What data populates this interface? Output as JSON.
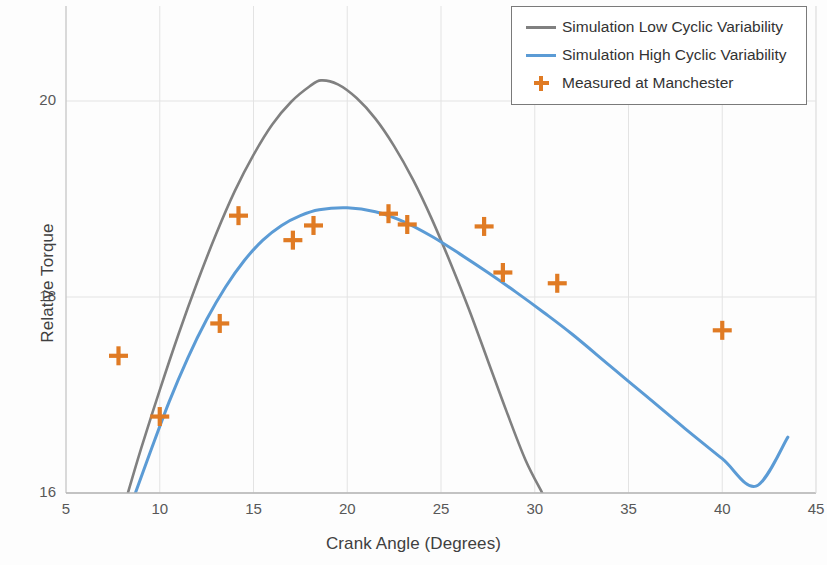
{
  "chart_data": {
    "type": "line",
    "title": "",
    "xlabel": "Crank Angle (Degrees)",
    "ylabel": "Relative Torque",
    "xlim": [
      5,
      45
    ],
    "ylim": [
      16,
      20.45
    ],
    "xticks": [
      5,
      10,
      15,
      20,
      25,
      30,
      35,
      40,
      45
    ],
    "yticks": [
      16,
      18,
      20
    ],
    "grid": true,
    "legend_position": "top-right",
    "series": [
      {
        "name": "Simulation Low Cyclic Variability",
        "type": "line",
        "color": "#808080",
        "points": [
          [
            8.3,
            16.0
          ],
          [
            9.0,
            16.45
          ],
          [
            10.0,
            17.05
          ],
          [
            11.0,
            17.62
          ],
          [
            12.0,
            18.15
          ],
          [
            13.0,
            18.64
          ],
          [
            14.0,
            19.08
          ],
          [
            15.0,
            19.45
          ],
          [
            16.0,
            19.76
          ],
          [
            17.0,
            19.99
          ],
          [
            18.0,
            20.15
          ],
          [
            18.6,
            20.21
          ],
          [
            19.5,
            20.17
          ],
          [
            20.5,
            20.03
          ],
          [
            21.5,
            19.82
          ],
          [
            22.5,
            19.54
          ],
          [
            23.5,
            19.2
          ],
          [
            24.5,
            18.8
          ],
          [
            25.5,
            18.35
          ],
          [
            26.5,
            17.87
          ],
          [
            27.5,
            17.35
          ],
          [
            28.5,
            16.83
          ],
          [
            29.5,
            16.34
          ],
          [
            30.4,
            16.0
          ]
        ]
      },
      {
        "name": "Simulation High Cyclic Variability",
        "type": "line",
        "color": "#5B9BD5",
        "points": [
          [
            8.7,
            16.0
          ],
          [
            9.5,
            16.42
          ],
          [
            10.5,
            16.93
          ],
          [
            11.5,
            17.38
          ],
          [
            12.5,
            17.77
          ],
          [
            13.5,
            18.1
          ],
          [
            14.5,
            18.37
          ],
          [
            15.5,
            18.58
          ],
          [
            16.5,
            18.73
          ],
          [
            17.5,
            18.83
          ],
          [
            18.5,
            18.89
          ],
          [
            20.0,
            18.91
          ],
          [
            21.5,
            18.87
          ],
          [
            23.0,
            18.77
          ],
          [
            24.5,
            18.62
          ],
          [
            26.0,
            18.44
          ],
          [
            27.5,
            18.25
          ],
          [
            29.0,
            18.05
          ],
          [
            30.5,
            17.84
          ],
          [
            32.0,
            17.62
          ],
          [
            34.0,
            17.3
          ],
          [
            36.0,
            16.98
          ],
          [
            38.0,
            16.66
          ],
          [
            40.0,
            16.35
          ],
          [
            41.8,
            16.07
          ],
          [
            43.5,
            16.57
          ]
        ]
      },
      {
        "name": "Measured at Manchester",
        "type": "scatter",
        "color": "#E07B24",
        "points": [
          [
            7.8,
            17.4
          ],
          [
            10.0,
            16.78
          ],
          [
            13.2,
            17.73
          ],
          [
            14.2,
            18.83
          ],
          [
            17.1,
            18.58
          ],
          [
            18.2,
            18.73
          ],
          [
            22.2,
            18.85
          ],
          [
            23.2,
            18.74
          ],
          [
            27.3,
            18.72
          ],
          [
            28.3,
            18.25
          ],
          [
            31.2,
            18.14
          ],
          [
            40.0,
            17.66
          ]
        ]
      }
    ]
  },
  "legend": {
    "items": [
      {
        "label": "Simulation Low Cyclic Variability",
        "key": "line",
        "color": "#808080"
      },
      {
        "label": "Simulation High Cyclic Variability",
        "key": "line",
        "color": "#5B9BD5"
      },
      {
        "label": "Measured at Manchester",
        "key": "cross",
        "color": "#E07B24"
      }
    ]
  },
  "axes": {
    "x_title": "Crank Angle (Degrees)",
    "y_title": "Relative Torque",
    "x_tick_labels": [
      "5",
      "10",
      "15",
      "20",
      "25",
      "30",
      "35",
      "40",
      "45"
    ],
    "y_tick_labels": [
      "16",
      "18",
      "20"
    ]
  }
}
